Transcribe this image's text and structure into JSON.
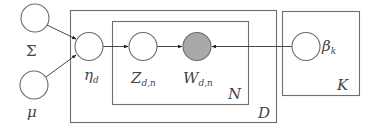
{
  "diagram": {
    "type": "plate-notation-graphical-model",
    "colors": {
      "plate_stroke": "#6e6e6e",
      "node_stroke": "#6a6a6a",
      "observed_fill": "#a9a9a9",
      "latent_fill": "#ffffff",
      "edge": "#333333"
    },
    "nodes": [
      {
        "id": "sigma",
        "label": "Σ",
        "observed": false
      },
      {
        "id": "mu",
        "label": "μ",
        "observed": false
      },
      {
        "id": "eta",
        "label": "η",
        "subscript": "d",
        "observed": false
      },
      {
        "id": "z",
        "label": "Z",
        "subscript": "d,n",
        "observed": false
      },
      {
        "id": "w",
        "label": "W",
        "subscript": "d,n",
        "observed": true
      },
      {
        "id": "beta",
        "label": "β",
        "subscript": "k",
        "observed": false
      }
    ],
    "edges": [
      {
        "from": "sigma",
        "to": "eta"
      },
      {
        "from": "mu",
        "to": "eta"
      },
      {
        "from": "eta",
        "to": "z"
      },
      {
        "from": "z",
        "to": "w"
      },
      {
        "from": "beta",
        "to": "w"
      }
    ],
    "plates": [
      {
        "id": "D",
        "label": "D",
        "contains": [
          "eta",
          "z",
          "w"
        ]
      },
      {
        "id": "N",
        "label": "N",
        "contains": [
          "z",
          "w"
        ]
      },
      {
        "id": "K",
        "label": "K",
        "contains": [
          "beta"
        ]
      }
    ]
  }
}
